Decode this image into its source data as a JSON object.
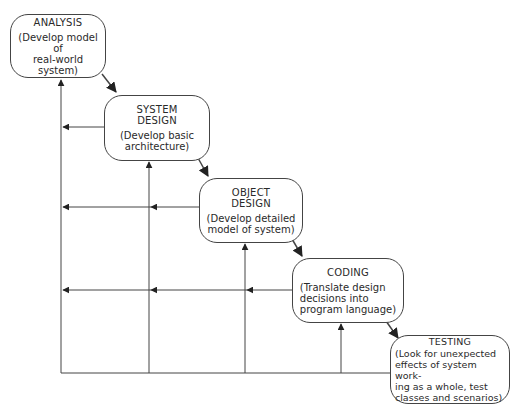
{
  "diagram": {
    "type": "waterfall-process-with-feedback",
    "stages": [
      {
        "id": "analysis",
        "title": "ANALYSIS",
        "description": "(Develop model of\nreal-world system)"
      },
      {
        "id": "system_design",
        "title": "SYSTEM\nDESIGN",
        "description": "(Develop basic\narchitecture)"
      },
      {
        "id": "object_design",
        "title": "OBJECT\nDESIGN",
        "description": "(Develop detailed\nmodel of system)"
      },
      {
        "id": "coding",
        "title": "CODING",
        "description": "(Translate design\ndecisions into\nprogram language)"
      },
      {
        "id": "testing",
        "title": "TESTING",
        "description": "(Look for unexpected\neffects of system work-\ning as a whole, test\nclasses and scenarios)"
      }
    ],
    "forward_edges": [
      [
        "analysis",
        "system_design"
      ],
      [
        "system_design",
        "object_design"
      ],
      [
        "object_design",
        "coding"
      ],
      [
        "coding",
        "testing"
      ]
    ],
    "feedback_edges": "each later stage feeds back to all earlier stages via leftward arrows and upward return lines",
    "colors": {
      "stroke": "#333333",
      "background": "#ffffff",
      "text": "#2a2a2a"
    }
  }
}
